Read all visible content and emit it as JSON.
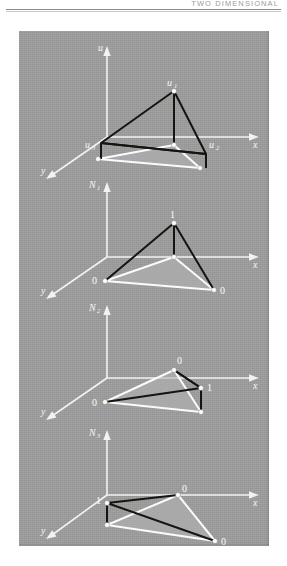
{
  "header": {
    "running_title": "TWO DIMENSIONAL"
  },
  "figure": {
    "background_color": "#9d9d9d",
    "line_color_light": "#fbfbfb",
    "line_color_dark": "#15150f",
    "panels": [
      {
        "id": "panel-element",
        "vertical_axis_label": "u",
        "vertical_axis_sub": "",
        "x_axis_label": "x",
        "y_axis_label": "y",
        "node_labels": [
          {
            "text": "u",
            "sub": "1",
            "position": "apex"
          },
          {
            "text": "u",
            "sub": "2",
            "position": "right"
          },
          {
            "text": "u",
            "sub": "3",
            "position": "left"
          }
        ]
      },
      {
        "id": "panel-n1",
        "vertical_axis_label": "N",
        "vertical_axis_sub": "1",
        "x_axis_label": "x",
        "y_axis_label": "y",
        "node_labels": [
          {
            "text": "1",
            "sub": "",
            "position": "apex"
          },
          {
            "text": "0",
            "sub": "",
            "position": "left"
          },
          {
            "text": "0",
            "sub": "",
            "position": "right"
          }
        ]
      },
      {
        "id": "panel-n2",
        "vertical_axis_label": "N",
        "vertical_axis_sub": "2",
        "x_axis_label": "x",
        "y_axis_label": "y",
        "node_labels": [
          {
            "text": "0",
            "sub": "",
            "position": "top"
          },
          {
            "text": "0",
            "sub": "",
            "position": "left"
          },
          {
            "text": "1",
            "sub": "",
            "position": "right"
          }
        ]
      },
      {
        "id": "panel-n3",
        "vertical_axis_label": "N",
        "vertical_axis_sub": "3",
        "x_axis_label": "x",
        "y_axis_label": "y",
        "node_labels": [
          {
            "text": "1",
            "sub": "",
            "position": "left"
          },
          {
            "text": "0",
            "sub": "",
            "position": "top"
          },
          {
            "text": "0",
            "sub": "",
            "position": "right"
          }
        ]
      }
    ]
  }
}
